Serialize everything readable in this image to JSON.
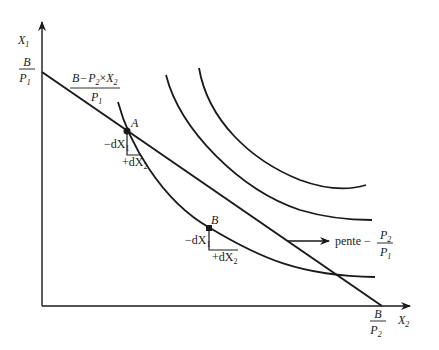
{
  "diagram": {
    "type": "indifference-curves-budget-constraint",
    "axes": {
      "y_label": {
        "var": "X",
        "sub": "1"
      },
      "x_label": {
        "var": "X",
        "sub": "2"
      }
    },
    "intercepts": {
      "y": {
        "num": "B",
        "den_var": "P",
        "den_sub": "1"
      },
      "x": {
        "num": "B",
        "den_var": "P",
        "den_sub": "2"
      }
    },
    "budget_formula": {
      "num_B": "B",
      "num_minus": "−",
      "num_P": "P",
      "num_P_sub": "2",
      "num_times": "×",
      "num_X": "X",
      "num_X_sub": "2",
      "den_var": "P",
      "den_sub": "1"
    },
    "points": [
      {
        "label": "A",
        "dx1": "−dX",
        "dx1_sub": "1",
        "dx2": "+dX",
        "dx2_sub": "2"
      },
      {
        "label": "B",
        "dx1": "−dX",
        "dx1_sub": "1",
        "dx2": "+dX",
        "dx2_sub": "2"
      }
    ],
    "slope_annotation": {
      "text": "pente −",
      "num_var": "P",
      "num_sub": "2",
      "den_var": "P",
      "den_sub": "1"
    },
    "indifference_curves": [
      "IC1",
      "IC2",
      "IC3"
    ]
  }
}
